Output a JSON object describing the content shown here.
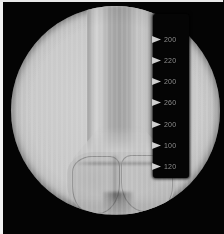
{
  "image": {
    "modality_label": "fluoroscopic radiograph",
    "anatomy_label": "distal femur",
    "background_color": "#000000",
    "field_of_view_shape": "circle",
    "border_color": "#f2f2f2"
  },
  "scale_overlay": {
    "units": "mm",
    "ticks": [
      {
        "label": "200",
        "y": 20
      },
      {
        "label": "220",
        "y": 41
      },
      {
        "label": "200",
        "y": 62
      },
      {
        "label": "260",
        "y": 83
      },
      {
        "label": "200",
        "y": 105
      },
      {
        "label": "100",
        "y": 126
      },
      {
        "label": "120",
        "y": 147
      }
    ]
  }
}
